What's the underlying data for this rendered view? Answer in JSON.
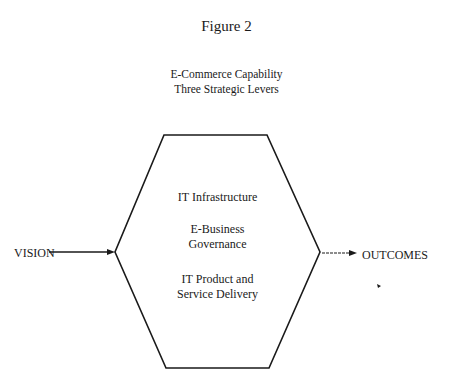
{
  "figure": {
    "title": "Figure 2",
    "subtitle_line1": "E-Commerce Capability",
    "subtitle_line2": "Three Strategic Levers"
  },
  "diagram": {
    "input_label": "VISION",
    "output_label": "OUTCOMES",
    "levers": [
      {
        "line1": "IT Infrastructure",
        "line2": ""
      },
      {
        "line1": "E-Business",
        "line2": "Governance"
      },
      {
        "line1": "IT Product and",
        "line2": "Service Delivery"
      }
    ],
    "stroke_color": "#1a1a1a"
  }
}
